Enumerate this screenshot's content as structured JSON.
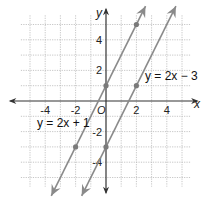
{
  "chart_data": {
    "type": "line",
    "title": "",
    "xlabel": "x",
    "ylabel": "y",
    "xlim": [
      -5,
      5
    ],
    "ylim": [
      -5,
      5
    ],
    "grid": true,
    "origin_label": "O",
    "x_ticks": [
      -4,
      -2,
      2,
      4
    ],
    "y_ticks": [
      4,
      2,
      -2,
      -4
    ],
    "x_tick_labels": [
      "-4",
      "-2",
      "2",
      "4"
    ],
    "y_tick_labels": [
      "4",
      "2",
      "-2",
      "-4"
    ],
    "series": [
      {
        "name": "y = 2x + 1",
        "slope": 2,
        "intercept": 1,
        "points": [
          [
            -2,
            -3
          ],
          [
            0,
            1
          ],
          [
            2,
            5
          ]
        ],
        "label_position": [
          -4.5,
          -2.5
        ]
      },
      {
        "name": "y = 2x − 3",
        "slope": 2,
        "intercept": -3,
        "points": [
          [
            0,
            -3
          ],
          [
            2,
            1
          ]
        ],
        "label_position": [
          2.5,
          1.5
        ]
      }
    ],
    "colors": {
      "line": "#8a8a8a",
      "point": "#7a7a7a",
      "axis": "#333333",
      "grid": "#b8b8b8"
    }
  },
  "labels": {
    "x_axis": "x",
    "y_axis": "y",
    "origin": "O",
    "eq1": "y = 2x + 1",
    "eq2": "y = 2x − 3"
  }
}
